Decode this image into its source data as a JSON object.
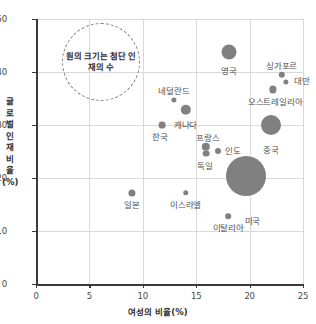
{
  "chart_data": {
    "type": "scatter",
    "title": "",
    "xlabel": "여성의 비율(%)",
    "ylabel": "글로벌 인재 비율(%)",
    "xlim": [
      0,
      25
    ],
    "ylim": [
      0,
      50
    ],
    "xticks": [
      "0",
      "5",
      "10",
      "15",
      "20",
      "25"
    ],
    "yticks": [
      "0",
      "10",
      "20",
      "30",
      "40",
      "50"
    ],
    "grid": "both",
    "legend": "none",
    "size_note": "원의 크기는 첨단 인재의 수",
    "points": [
      {
        "label": "영국",
        "x": 18.1,
        "y": 43.8,
        "r": 7.5,
        "label_dx": 0,
        "label_dy": 9
      },
      {
        "label": "싱가포르",
        "x": 23.0,
        "y": 39.5,
        "r": 3.2,
        "label_dx": 0,
        "label_dy": -15
      },
      {
        "label": "대만",
        "x": 23.4,
        "y": 38.2,
        "r": 2.6,
        "label_dx": 16,
        "label_dy": -6
      },
      {
        "label": "오스트레일리아",
        "x": 22.2,
        "y": 36.7,
        "r": 3.6,
        "label_dx": 2,
        "label_dy": 6
      },
      {
        "label": "네덜란드",
        "x": 12.9,
        "y": 34.7,
        "r": 2.6,
        "label_dx": 0,
        "label_dy": -15
      },
      {
        "label": "캐나다",
        "x": 14.0,
        "y": 32.9,
        "r": 5.2,
        "label_dx": 0,
        "label_dy": 7
      },
      {
        "label": "한국",
        "x": 11.8,
        "y": 30.0,
        "r": 3.4,
        "label_dx": -2,
        "label_dy": 6
      },
      {
        "label": "프랑스",
        "x": 15.9,
        "y": 25.9,
        "r": 4.2,
        "label_dx": 2,
        "label_dy": -16
      },
      {
        "label": "인도",
        "x": 17.0,
        "y": 25.1,
        "r": 3.0,
        "label_dx": 15,
        "label_dy": -6
      },
      {
        "label": "독일",
        "x": 15.9,
        "y": 24.6,
        "r": 3.4,
        "label_dx": -1,
        "label_dy": 6
      },
      {
        "label": "중국",
        "x": 22.0,
        "y": 30.0,
        "r": 10.0,
        "label_dx": 0,
        "label_dy": 12
      },
      {
        "label": "미국",
        "x": 19.7,
        "y": 20.4,
        "r": 20.0,
        "label_dx": 6,
        "label_dy": 22
      },
      {
        "label": "일본",
        "x": 9.0,
        "y": 17.2,
        "r": 3.6,
        "label_dx": 0,
        "label_dy": 6
      },
      {
        "label": "이스라엘",
        "x": 14.0,
        "y": 17.2,
        "r": 2.8,
        "label_dx": 0,
        "label_dy": 6
      },
      {
        "label": "이탈리아",
        "x": 18.0,
        "y": 12.8,
        "r": 2.8,
        "label_dx": 0,
        "label_dy": 6
      }
    ]
  }
}
